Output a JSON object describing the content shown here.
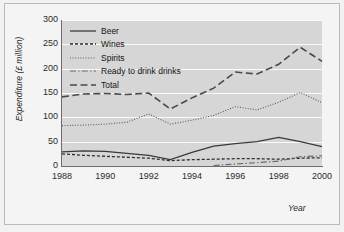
{
  "chart_data": {
    "type": "line",
    "title": "",
    "xlabel": "Year",
    "ylabel": "Expenditure (£ million)",
    "xlim": [
      1988,
      2000
    ],
    "ylim": [
      0,
      300
    ],
    "yticks": [
      0,
      50,
      100,
      150,
      200,
      250,
      300
    ],
    "xticks": [
      1988,
      1990,
      1992,
      1994,
      1996,
      1998,
      2000
    ],
    "xticklabels": [
      "1988",
      "1990",
      "1992",
      "1994",
      "1996",
      "1998",
      "2000"
    ],
    "yticklabels": [
      "0",
      "50",
      "100",
      "150",
      "200",
      "250",
      "300"
    ],
    "grid": "horizontal",
    "legend_position": "upper left",
    "x": [
      1988,
      1989,
      1990,
      1991,
      1992,
      1993,
      1994,
      1995,
      1996,
      1997,
      1998,
      1999,
      2000
    ],
    "series": [
      {
        "name": "Beer",
        "style": "solid",
        "color": "#3a3a3a",
        "values": [
          29,
          31,
          30,
          26,
          22,
          13,
          28,
          41,
          46,
          50,
          59,
          50,
          40
        ]
      },
      {
        "name": "Wines",
        "style": "dashed",
        "color": "#2e2e2e",
        "values": [
          25,
          22,
          20,
          18,
          16,
          11,
          13,
          14,
          15,
          15,
          14,
          16,
          17
        ]
      },
      {
        "name": "Spirits",
        "style": "dotted",
        "color": "#5c5c5c",
        "values": [
          83,
          84,
          86,
          90,
          107,
          86,
          94,
          104,
          122,
          115,
          131,
          151,
          130
        ]
      },
      {
        "name": "Ready to drink drinks",
        "style": "dashdot",
        "color": "#6a6a6a",
        "values": [
          null,
          null,
          null,
          null,
          null,
          null,
          null,
          1,
          4,
          7,
          10,
          19,
          21
        ]
      },
      {
        "name": "Total",
        "style": "longdash",
        "color": "#4a4a4a",
        "values": [
          142,
          148,
          149,
          147,
          150,
          117,
          140,
          160,
          193,
          189,
          209,
          244,
          215
        ]
      }
    ]
  },
  "legend": {
    "items": [
      {
        "label": "Beer"
      },
      {
        "label": "Wines"
      },
      {
        "label": "Spirits"
      },
      {
        "label": "Ready to drink drinks"
      },
      {
        "label": "Total"
      }
    ]
  },
  "colors": {
    "figure_background": "#f2f2f2",
    "frame_background": "#f4f4f4",
    "plot_background": "#d6d6d6",
    "gridline": "#fafafa",
    "axis": "#6d6d6d",
    "text": "#1f1f1f"
  }
}
